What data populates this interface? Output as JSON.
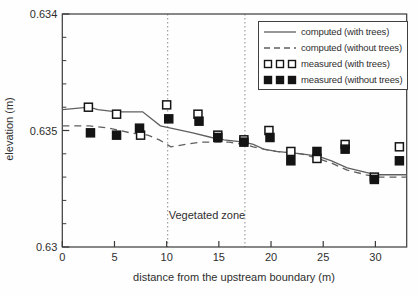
{
  "figure": {
    "x_axis_title": "distance from the upstream boundary (m)",
    "y_axis_title": "elevation (m)",
    "zone_label": "Vegetated zone"
  },
  "legend": {
    "items": [
      {
        "label": "computed (with trees)",
        "marker": "solid-line"
      },
      {
        "label": "computed (without trees)",
        "marker": "dashed-line"
      },
      {
        "label": "measured (with trees)",
        "marker": "open-squares"
      },
      {
        "label": "measured (without trees)",
        "marker": "filled-squares"
      }
    ]
  },
  "chart_data": {
    "type": "line",
    "title": "",
    "xlabel": "distance from the upstream boundary (m)",
    "ylabel": "elevation (m)",
    "xlim": [
      0,
      33
    ],
    "ylim": [
      0.63,
      0.64
    ],
    "grid": false,
    "legend_position": "top-right",
    "x_ticks": {
      "values": [
        0,
        5,
        10,
        15,
        20,
        25,
        30
      ],
      "labels": [
        "0",
        "5",
        "10",
        "15",
        "20",
        "25",
        "30"
      ]
    },
    "y_ticks": {
      "minor_step": 0.001,
      "ticks": [
        {
          "value": 0.63,
          "label": "0.63"
        },
        {
          "value": 0.635,
          "label": "0.635"
        },
        {
          "value": 0.64,
          "label": "0.634"
        }
      ]
    },
    "vegetated_zone": {
      "x_start": 10.1,
      "x_end": 17.5,
      "label": "Vegetated zone"
    },
    "series": [
      {
        "name": "computed (with trees)",
        "type": "line",
        "style": "solid",
        "points": [
          [
            0,
            0.6359
          ],
          [
            2.6,
            0.636
          ],
          [
            3.4,
            0.6359
          ],
          [
            5.2,
            0.6358
          ],
          [
            7.7,
            0.6358
          ],
          [
            9.4,
            0.6352
          ],
          [
            10.4,
            0.6351
          ],
          [
            12.5,
            0.6349
          ],
          [
            14.3,
            0.6347
          ],
          [
            15.5,
            0.6346
          ],
          [
            17.4,
            0.6345
          ],
          [
            18.3,
            0.6344
          ],
          [
            19.3,
            0.6342
          ],
          [
            20.5,
            0.6341
          ],
          [
            22.9,
            0.634
          ],
          [
            24.5,
            0.6339
          ],
          [
            25.8,
            0.6337
          ],
          [
            27.3,
            0.6334
          ],
          [
            29.1,
            0.6332
          ],
          [
            30.1,
            0.6331
          ],
          [
            33,
            0.6331
          ]
        ]
      },
      {
        "name": "computed (without trees)",
        "type": "line",
        "style": "dashed",
        "points": [
          [
            0,
            0.6352
          ],
          [
            2.6,
            0.6352
          ],
          [
            4.5,
            0.6351
          ],
          [
            6.5,
            0.6349
          ],
          [
            8.2,
            0.6348
          ],
          [
            9.3,
            0.6346
          ],
          [
            10.4,
            0.6343
          ],
          [
            11.8,
            0.6344
          ],
          [
            13.2,
            0.6345
          ],
          [
            16,
            0.6345
          ],
          [
            17.4,
            0.6344
          ],
          [
            18.3,
            0.6343
          ],
          [
            19.3,
            0.6342
          ],
          [
            20.5,
            0.6341
          ],
          [
            22.9,
            0.634
          ],
          [
            24.5,
            0.6338
          ],
          [
            25.8,
            0.6336
          ],
          [
            27.3,
            0.6333
          ],
          [
            29.1,
            0.6331
          ],
          [
            30.1,
            0.633
          ],
          [
            33,
            0.633
          ]
        ]
      },
      {
        "name": "measured (with trees)",
        "type": "scatter",
        "marker": "open-square",
        "points": [
          [
            2.5,
            0.636
          ],
          [
            5.2,
            0.6357
          ],
          [
            7.5,
            0.6348
          ],
          [
            10,
            0.6361
          ],
          [
            13,
            0.6357
          ],
          [
            14.9,
            0.6348
          ],
          [
            17.4,
            0.6346
          ],
          [
            19.8,
            0.635
          ],
          [
            21.9,
            0.6341
          ],
          [
            24.4,
            0.6338
          ],
          [
            27.1,
            0.6344
          ],
          [
            29.9,
            0.633
          ],
          [
            32.3,
            0.6343
          ]
        ]
      },
      {
        "name": "measured (without trees)",
        "type": "scatter",
        "marker": "filled-square",
        "points": [
          [
            2.7,
            0.6349
          ],
          [
            5.2,
            0.6348
          ],
          [
            7.4,
            0.6351
          ],
          [
            10.2,
            0.6355
          ],
          [
            13.1,
            0.6354
          ],
          [
            14.9,
            0.6347
          ],
          [
            17.4,
            0.6345
          ],
          [
            19.9,
            0.6347
          ],
          [
            21.9,
            0.6337
          ],
          [
            24.4,
            0.6341
          ],
          [
            27.1,
            0.6342
          ],
          [
            29.9,
            0.6329
          ],
          [
            32.3,
            0.6337
          ]
        ]
      }
    ],
    "colors": {
      "line": "#5f5f5f",
      "marker": "#141414",
      "axis": "#3a3a3a",
      "zone_line": "#8f8f8f",
      "text": "#2e2e2e"
    }
  }
}
